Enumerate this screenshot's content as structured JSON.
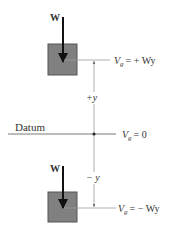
{
  "diagram": {
    "upper_block": {
      "force_label": "W",
      "potential_label": {
        "symbol": "V",
        "subscript": "g",
        "rhs": "= + Wy"
      }
    },
    "datum": {
      "label": "Datum",
      "potential_label": {
        "symbol": "V",
        "subscript": "g",
        "rhs": "= 0"
      }
    },
    "lower_block": {
      "force_label": "W",
      "potential_label": {
        "symbol": "V",
        "subscript": "g",
        "rhs": "= − Wy"
      }
    },
    "dimension_labels": {
      "positive": "+y",
      "negative": "− y"
    },
    "colors": {
      "block_fill": "#808080",
      "block_border": "#555555",
      "line": "#999999",
      "arrow": "#111111"
    }
  }
}
